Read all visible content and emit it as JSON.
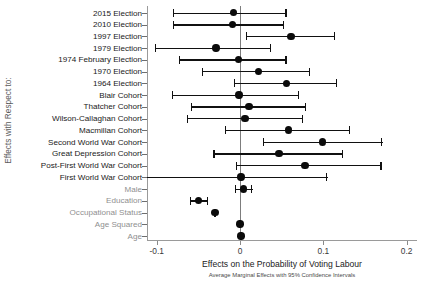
{
  "chart_data": {
    "type": "scatter",
    "orientation": "horizontal",
    "title": "",
    "xlabel": "Effects on the Probability of Voting Labour",
    "ylabel": "Effects with Respect to:",
    "note": "Average Marginal Effects with 95% Confidence Intervals",
    "xlim": [
      -0.12,
      0.21
    ],
    "xticks": [
      -0.1,
      0,
      0.1,
      0.2
    ],
    "xtick_labels": [
      "-0.1",
      "0",
      "0.1",
      "0.2"
    ],
    "grid": false,
    "reference_line": 0,
    "categories": [
      "2015 Election",
      "2010 Election",
      "1997 Election",
      "1979 Election",
      "1974 February Election",
      "1970 Election",
      "1964 Election",
      "Blair Cohort",
      "Thatcher Cohort",
      "Wilson-Callaghan Cohort",
      "Macmillan Cohort",
      "Second World War Cohort",
      "Great Depression Cohort",
      "Post-First World War Cohort",
      "First World War Cohort",
      "Male",
      "Education",
      "Occupational Status",
      "Age Squared",
      "Age"
    ],
    "muted_categories": [
      "Male",
      "Education",
      "Occupational Status",
      "Age Squared",
      "Age"
    ],
    "points": [
      {
        "label": "2015 Election",
        "estimate": -0.008,
        "ci_low": -0.081,
        "ci_high": 0.056
      },
      {
        "label": "2010 Election",
        "estimate": -0.009,
        "ci_low": -0.081,
        "ci_high": 0.053
      },
      {
        "label": "1997 Election",
        "estimate": 0.061,
        "ci_low": 0.007,
        "ci_high": 0.114
      },
      {
        "label": "1979 Election",
        "estimate": -0.029,
        "ci_low": -0.102,
        "ci_high": 0.037
      },
      {
        "label": "1974 February Election",
        "estimate": -0.002,
        "ci_low": -0.073,
        "ci_high": 0.056
      },
      {
        "label": "1970 Election",
        "estimate": 0.022,
        "ci_low": -0.046,
        "ci_high": 0.084
      },
      {
        "label": "1964 Election",
        "estimate": 0.056,
        "ci_low": -0.007,
        "ci_high": 0.117
      },
      {
        "label": "Blair Cohort",
        "estimate": -0.001,
        "ci_low": -0.082,
        "ci_high": 0.071
      },
      {
        "label": "Thatcher Cohort",
        "estimate": 0.011,
        "ci_low": -0.059,
        "ci_high": 0.079
      },
      {
        "label": "Wilson-Callaghan Cohort",
        "estimate": 0.006,
        "ci_low": -0.064,
        "ci_high": 0.076
      },
      {
        "label": "Macmillan Cohort",
        "estimate": 0.058,
        "ci_low": -0.018,
        "ci_high": 0.132
      },
      {
        "label": "Second World War Cohort",
        "estimate": 0.099,
        "ci_low": 0.027,
        "ci_high": 0.171
      },
      {
        "label": "Great Depression Cohort",
        "estimate": 0.047,
        "ci_low": -0.032,
        "ci_high": 0.124
      },
      {
        "label": "Post-First World War Cohort",
        "estimate": 0.078,
        "ci_low": -0.005,
        "ci_high": 0.17
      },
      {
        "label": "First World War Cohort",
        "estimate": 0.001,
        "ci_low": -0.133,
        "ci_high": 0.105
      },
      {
        "label": "Male",
        "estimate": 0.004,
        "ci_low": -0.006,
        "ci_high": 0.015
      },
      {
        "label": "Education",
        "estimate": -0.05,
        "ci_low": -0.06,
        "ci_high": -0.038
      },
      {
        "label": "Occupational Status",
        "estimate": -0.03,
        "ci_low": -0.031,
        "ci_high": -0.029
      },
      {
        "label": "Age Squared",
        "estimate": 0.0,
        "ci_low": -0.001,
        "ci_high": 0.001
      },
      {
        "label": "Age",
        "estimate": 0.001,
        "ci_low": 0.0,
        "ci_high": 0.002
      }
    ]
  }
}
